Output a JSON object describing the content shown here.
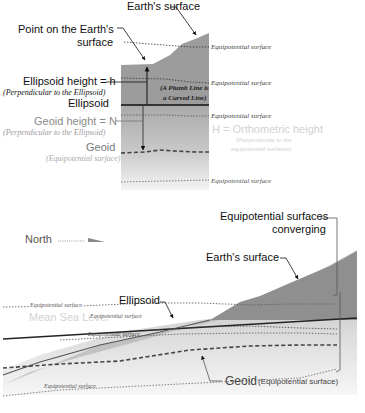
{
  "top_diagram": {
    "earths_surface": "Earth's surface",
    "point_label_1": "Point on the Earth's",
    "point_label_2": "surface",
    "ellipsoid_height": "Ellipsoid height = h",
    "ellipsoid_height_note": "(Perpendicular to the Ellipsoid)",
    "ellipsoid": "Ellipsoid",
    "geoid_height": "Geoid height = N",
    "geoid_height_note": "(Perpendicular to the Ellipsoid)",
    "geoid": "Geoid",
    "geoid_note": "(Equipotential surface)",
    "plumb_line_1": "(A Plumb Line is",
    "plumb_line_2": "a Curved Line)",
    "equipotential_1": "Equipotential surface",
    "equipotential_2": "Equipotential surface",
    "equipotential_3": "Equipotential surface",
    "equipotential_4": "Equipotential surface",
    "orthometric": "H = Orthometric height",
    "orthometric_note_1": "(Perpendicular to the",
    "orthometric_note_2": "equipotential surfaces)"
  },
  "bottom_diagram": {
    "north": "North",
    "equipotential_converging_1": "Equipotential surfaces",
    "equipotential_converging_2": "converging",
    "earths_surface": "Earth's surface",
    "ellipsoid": "Ellipsoid",
    "mean_sea_level": "Mean Sea Level",
    "equipotential_1": "Equipotential surface",
    "equipotential_2": "Equipotential surface",
    "equipotential_3": "Equipotential surface",
    "equipotential_4": "Equipotential surface",
    "geoid": "Geoid",
    "geoid_note": "(Equipotential surface)"
  }
}
